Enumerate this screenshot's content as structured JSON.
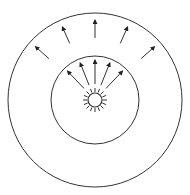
{
  "diagram": {
    "colors": {
      "stroke": "#333333",
      "background": "#ffffff"
    },
    "center": [
      95,
      100
    ],
    "outer_circle_radius": 87,
    "inner_circle_radius": 44,
    "source": {
      "icon": "sun-icon",
      "radius": 7,
      "ray_length": 12,
      "ray_count": 16
    },
    "inner_arrows": {
      "count": 5,
      "start_r": 16,
      "end_r": 40
    },
    "outer_arrows": {
      "count": 5,
      "start_r": 62,
      "end_r": 80
    }
  }
}
